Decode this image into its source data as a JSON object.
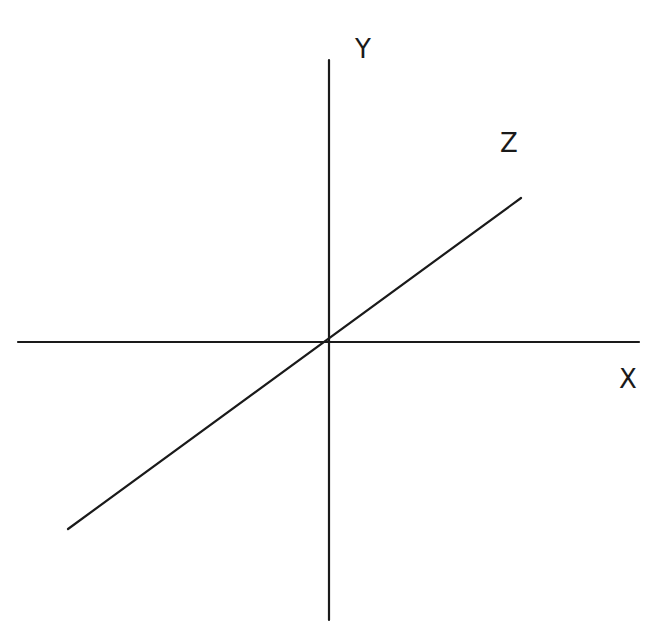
{
  "diagram": {
    "type": "3d-coordinate-axes",
    "stroke_color": "#1a1a1a",
    "axes": [
      {
        "name": "X",
        "label": "X",
        "x1": 18,
        "y1": 342,
        "x2": 639,
        "y2": 342,
        "label_x": 628,
        "label_y": 388
      },
      {
        "name": "Y",
        "label": "Y",
        "x1": 329,
        "y1": 60,
        "x2": 329,
        "y2": 620,
        "label_x": 363,
        "label_y": 58
      },
      {
        "name": "Z",
        "label": "Z",
        "x1": 68,
        "y1": 529,
        "x2": 521,
        "y2": 198,
        "label_x": 509,
        "label_y": 152
      }
    ],
    "origin": {
      "x": 329,
      "y": 342
    }
  }
}
